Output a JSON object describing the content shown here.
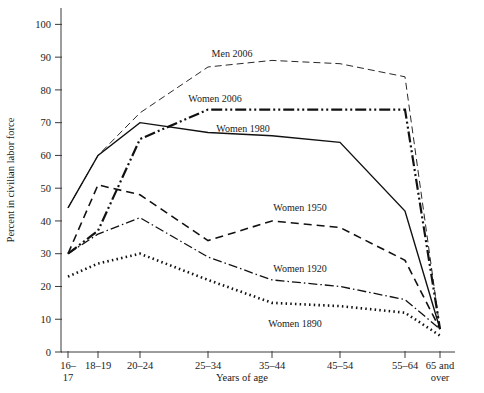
{
  "chart_data": {
    "type": "line",
    "title": "",
    "xlabel": "Years of age",
    "ylabel": "Percent in civilian labor force",
    "categories": [
      "16–\n17",
      "18–19",
      "20–24",
      "25–34",
      "35–44",
      "45–54",
      "55–64",
      "65 and\nover"
    ],
    "category_lines": [
      [
        "16–",
        "17"
      ],
      [
        "18–19"
      ],
      [
        "20–24"
      ],
      [
        "25–34"
      ],
      [
        "35–44"
      ],
      [
        "45–54"
      ],
      [
        "55–64"
      ],
      [
        "65 and",
        "over"
      ]
    ],
    "ylim": [
      0,
      105
    ],
    "yticks": [
      0,
      10,
      20,
      30,
      40,
      50,
      60,
      70,
      80,
      90,
      100
    ],
    "ytick_labels": [
      "0",
      "10",
      "20",
      "30",
      "40",
      "50",
      "60",
      "70",
      "80",
      "90",
      "100"
    ],
    "grid": false,
    "legend": "inline-labels",
    "series": [
      {
        "name": "Men 2006",
        "label": "Men 2006",
        "style": "long-dash",
        "dash": "7,4",
        "width": 0.9,
        "label_x": 232,
        "label_y": 57,
        "values": [
          44,
          60,
          73,
          87,
          89,
          88,
          84,
          7
        ]
      },
      {
        "name": "Women 2006",
        "label": "Women 2006",
        "style": "dash-dot-dot",
        "dash": "11,3,2,3,2,3",
        "width": 2.2,
        "label_x": 215,
        "label_y": 102,
        "values": [
          30,
          37,
          65,
          74,
          74,
          74,
          74,
          7
        ]
      },
      {
        "name": "Women 1980",
        "label": "Women 1980",
        "style": "solid",
        "dash": "0",
        "width": 1.4,
        "label_x": 243,
        "label_y": 132,
        "values": [
          44,
          60,
          70,
          67,
          66,
          64,
          43,
          7
        ]
      },
      {
        "name": "Women 1950",
        "label": "Women 1950",
        "style": "dash",
        "dash": "8,5",
        "width": 1.6,
        "label_x": 300,
        "label_y": 211,
        "values": [
          30,
          51,
          48,
          34,
          40,
          38,
          28,
          7
        ]
      },
      {
        "name": "Women 1920",
        "label": "Women 1920",
        "style": "dash-dot",
        "dash": "9,3,1.5,3",
        "width": 1.3,
        "label_x": 300,
        "label_y": 272,
        "values": [
          30,
          36,
          41,
          29,
          22,
          20,
          16,
          7
        ]
      },
      {
        "name": "Women 1890",
        "label": "Women 1890",
        "style": "dotted",
        "dash": "1.5,3.2",
        "width": 2.6,
        "label_x": 295,
        "label_y": 327,
        "values": [
          23,
          27,
          30,
          22,
          15,
          14,
          12,
          5
        ]
      }
    ]
  },
  "axes": {
    "y_axis_title": "Percent in civilian labor force",
    "x_axis_title": "Years of age"
  }
}
